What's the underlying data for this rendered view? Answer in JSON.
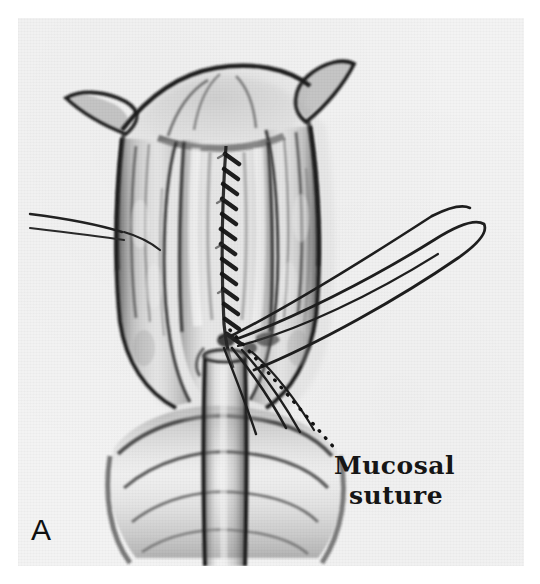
{
  "figure": {
    "panel_letter": "A",
    "medium": "halftone-scanned pen-and-ink surgical illustration",
    "paper_color": "#f3f3f3",
    "ink_color": "#1a1a1a"
  },
  "annotations": [
    {
      "id": "mucosal-suture",
      "line1": "Mucosal",
      "line2": "suture",
      "leader": "dotted",
      "leader_from": [
        206,
        314
      ],
      "leader_to": [
        330,
        440
      ]
    }
  ],
  "structures": [
    {
      "name": "mucosal-suture-line",
      "description": "continuous running stitch down midline"
    },
    {
      "name": "tissue-flap-left",
      "description": "reflected longitudinal muscle flap"
    },
    {
      "name": "tissue-flap-right",
      "description": "reflected longitudinal muscle flap"
    },
    {
      "name": "suture-thread-left",
      "description": "traction thread exiting to left"
    },
    {
      "name": "suture-thread-right-loop",
      "description": "long suture loop exiting to upper right"
    },
    {
      "name": "catheter-tube",
      "description": "tube descending through lumen"
    },
    {
      "name": "tissue-folds-lower",
      "description": "transverse tissue folds at base"
    }
  ]
}
